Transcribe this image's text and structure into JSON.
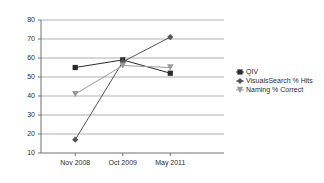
{
  "chart_data": {
    "type": "line",
    "title": "",
    "xlabel": "",
    "ylabel": "",
    "categories": [
      "Nov 2008",
      "Oct 2009",
      "May 2011"
    ],
    "ylim": [
      10,
      80
    ],
    "ytick_labels": [
      "80",
      "70",
      "60",
      "50",
      "40",
      "30",
      "20",
      "10"
    ],
    "ytick_values": [
      80,
      70,
      60,
      50,
      40,
      30,
      20,
      10
    ],
    "grid": true,
    "legend_position": "right",
    "series": [
      {
        "name": "QIV",
        "marker": "square",
        "color": "#2a2a2a",
        "values": [
          55,
          59,
          52
        ]
      },
      {
        "name": "VisualsSearch % Hits",
        "marker": "diamond",
        "color": "#555555",
        "values": [
          17,
          58,
          71
        ]
      },
      {
        "name": "Naming % Correct",
        "marker": "triangle-down",
        "color": "#9a9a9a",
        "values": [
          41,
          56,
          55
        ]
      }
    ]
  },
  "legend": {
    "items": [
      {
        "label": "QIV"
      },
      {
        "label": "VisualsSearch % Hits"
      },
      {
        "label": "Naming % Correct"
      }
    ]
  },
  "axis": {
    "y_labels": [
      "80",
      "70",
      "60",
      "50",
      "40",
      "30",
      "20",
      "10"
    ],
    "x_labels": [
      "Nov 2008",
      "Oct 2009",
      "May 2011"
    ]
  }
}
